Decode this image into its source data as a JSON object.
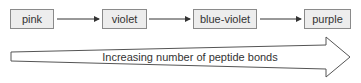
{
  "diagram": {
    "stages": [
      {
        "label": "pink"
      },
      {
        "label": "violet"
      },
      {
        "label": "blue-violet"
      },
      {
        "label": "purple"
      }
    ],
    "big_arrow": {
      "label": "Increasing number of peptide bonds"
    },
    "colors": {
      "box_fill": "#ededed",
      "box_border": "#8a8a8a",
      "line": "#333333",
      "text": "#333333"
    }
  }
}
